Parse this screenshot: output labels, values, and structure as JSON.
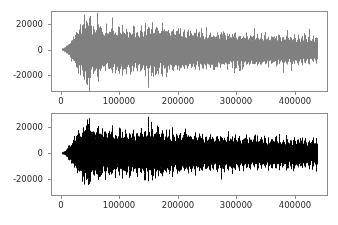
{
  "figure": {
    "width": 338,
    "height": 225,
    "background": "#ffffff",
    "frame_color": "#8c8c8c",
    "tick_label_color": "#2b2b2b"
  },
  "chart_data": [
    {
      "id": "top-waveform",
      "type": "area",
      "title": "",
      "xlabel": "",
      "ylabel": "",
      "series_color": "#808080",
      "xlim": [
        -17000,
        457000
      ],
      "ylim": [
        -33000,
        30000
      ],
      "xticks": [
        0,
        100000,
        200000,
        300000,
        400000
      ],
      "xticklabels": [
        "0",
        "100000",
        "200000",
        "300000",
        "400000"
      ],
      "yticks": [
        -20000,
        0,
        20000
      ],
      "yticklabels": [
        "-20000",
        "0",
        "20000"
      ],
      "grid": false,
      "legend": "none",
      "data_start_x": 0,
      "data_end_x": 440000,
      "sample_count": 277,
      "envelope_peak_positive": [
        900,
        1100,
        1400,
        1800,
        2300,
        2900,
        3600,
        4400,
        5200,
        6100,
        7200,
        8400,
        9500,
        10400,
        11200,
        12600,
        15800,
        13400,
        12800,
        16200,
        14600,
        13200,
        17400,
        21900,
        19200,
        16800,
        22600,
        25200,
        18900,
        17200,
        23800,
        20400,
        15600,
        14800,
        18200,
        16400,
        13900,
        15200,
        19600,
        23400,
        17800,
        14200,
        12800,
        16600,
        14400,
        12200,
        13600,
        15800,
        13100,
        11800,
        14900,
        17200,
        13400,
        12100,
        15600,
        18400,
        14200,
        12600,
        16100,
        13800,
        11900,
        14700,
        16900,
        13200,
        12400,
        15100,
        17600,
        13900,
        12700,
        14300,
        16800,
        13500,
        11600,
        14100,
        16200,
        12900,
        11400,
        13700,
        15900,
        12600,
        11200,
        13900,
        16400,
        12800,
        11700,
        14600,
        17100,
        13300,
        12200,
        15400,
        18900,
        14100,
        12500,
        16300,
        19700,
        14800,
        13100,
        16900,
        21200,
        15400,
        13600,
        17800,
        14200,
        12400,
        15600,
        18200,
        13800,
        12100,
        15200,
        17400,
        13400,
        11800,
        14600,
        16800,
        12900,
        11500,
        14200,
        16100,
        12700,
        11300,
        13900,
        15800,
        12400,
        11100,
        13600,
        15400,
        12200,
        10900,
        13300,
        15100,
        12000,
        10700,
        13100,
        14900,
        11800,
        10500,
        12900,
        14600,
        11600,
        10300,
        12700,
        14400,
        11400,
        10200,
        12500,
        14200,
        11200,
        10000,
        12300,
        14000,
        11000,
        9900,
        12100,
        13800,
        10900,
        9800,
        12000,
        13700,
        10800,
        9700,
        11900,
        13600,
        10700,
        9600,
        11800,
        13500,
        10600,
        9500,
        11700,
        13400,
        10500,
        9400,
        11600,
        13300,
        10400,
        9300,
        11500,
        13200,
        10300,
        9200,
        11400,
        13100,
        10200,
        9100,
        11300,
        13000,
        10100,
        9000,
        11200,
        12900,
        10000,
        8900,
        11100,
        12800,
        9900,
        8800,
        11000,
        12700,
        9800,
        8700,
        10900,
        12600,
        9700,
        8600,
        10800,
        12500,
        9600,
        8500,
        10700,
        12400,
        9500,
        8400,
        10600,
        12300,
        9400,
        8300,
        10500,
        12200,
        9300,
        8200,
        10400,
        12100,
        9200,
        8100,
        10300,
        12000,
        9100,
        8000,
        10200,
        11900,
        9000,
        7900,
        10100,
        11800,
        8900,
        7800,
        10000,
        11700,
        8800,
        7700,
        9900,
        11600,
        8700,
        7600,
        9800,
        11500,
        8600,
        7500,
        9700,
        11400,
        8500,
        7400,
        9600,
        11300,
        8400,
        7300,
        9500,
        11200,
        8300,
        7200,
        9400,
        11100,
        8200,
        7100,
        9300,
        11000,
        8100,
        7000,
        9200,
        10900,
        8000,
        6900,
        9100,
        10800,
        7900,
        6800,
        9000,
        10700,
        7800
      ],
      "envelope_peak_negative": [
        -900,
        -1100,
        -1400,
        -1800,
        -2300,
        -2900,
        -3600,
        -4400,
        -5200,
        -6100,
        -7200,
        -8400,
        -9500,
        -10400,
        -11200,
        -12600,
        -14800,
        -13400,
        -12800,
        -15200,
        -14600,
        -13200,
        -17400,
        -23900,
        -26200,
        -19800,
        -24600,
        -28200,
        -21900,
        -18200,
        -25800,
        -22400,
        -16600,
        -15800,
        -19200,
        -17400,
        -14900,
        -16200,
        -20600,
        -24400,
        -18800,
        -15200,
        -13800,
        -17600,
        -15400,
        -13200,
        -14600,
        -16800,
        -14100,
        -12800,
        -15900,
        -18200,
        -14400,
        -13100,
        -16600,
        -19400,
        -15200,
        -13600,
        -17100,
        -14800,
        -12900,
        -15700,
        -17900,
        -14200,
        -13400,
        -16100,
        -18600,
        -14900,
        -13700,
        -15300,
        -17800,
        -14500,
        -12600,
        -15100,
        -17200,
        -13900,
        -12400,
        -14700,
        -16900,
        -13600,
        -12200,
        -14900,
        -17400,
        -13800,
        -12700,
        -15600,
        -18100,
        -14300,
        -13200,
        -16400,
        -19900,
        -15100,
        -13500,
        -17300,
        -26700,
        -15800,
        -14100,
        -17900,
        -22200,
        -16400,
        -14600,
        -18800,
        -15200,
        -13400,
        -16600,
        -19200,
        -14800,
        -13100,
        -16200,
        -18400,
        -14400,
        -12800,
        -15600,
        -17800,
        -13900,
        -12500,
        -15200,
        -17100,
        -13700,
        -12300,
        -14900,
        -16800,
        -13400,
        -12100,
        -14600,
        -16400,
        -13200,
        -11900,
        -14300,
        -16100,
        -13000,
        -11700,
        -14100,
        -15900,
        -12800,
        -11500,
        -13900,
        -15600,
        -12600,
        -11300,
        -13700,
        -15400,
        -12400,
        -11200,
        -13500,
        -15200,
        -12200,
        -11000,
        -13300,
        -15000,
        -12000,
        -10900,
        -13100,
        -14800,
        -11900,
        -10800,
        -13000,
        -14700,
        -11800,
        -10700,
        -12900,
        -14600,
        -11700,
        -10600,
        -12800,
        -14500,
        -11600,
        -10500,
        -12700,
        -14400,
        -11500,
        -10400,
        -12600,
        -14300,
        -11400,
        -10300,
        -12500,
        -14200,
        -11300,
        -10200,
        -12400,
        -14100,
        -11200,
        -10100,
        -12300,
        -14000,
        -11100,
        -10000,
        -12200,
        -13900,
        -11000,
        -9900,
        -12100,
        -13800,
        -10900,
        -9800,
        -12000,
        -13700,
        -10800,
        -9700,
        -11900,
        -13600,
        -10700,
        -9600,
        -11800,
        -13500,
        -10600,
        -9500,
        -11700,
        -13400,
        -10500,
        -9400,
        -11600,
        -13300,
        -10400,
        -9300,
        -11500,
        -13200,
        -10300,
        -9200,
        -11400,
        -13100,
        -10200,
        -9100,
        -11300,
        -13000,
        -10100,
        -9000,
        -11200,
        -12900,
        -10000,
        -8900,
        -11100,
        -12800,
        -9900,
        -8800,
        -11000,
        -12700,
        -9800,
        -8700,
        -10900,
        -12600,
        -9700,
        -8600,
        -10800,
        -12500,
        -9600,
        -8500,
        -10700,
        -12400,
        -9500,
        -8400,
        -10600,
        -12300,
        -9400,
        -8300,
        -10500,
        -12200,
        -9300,
        -8200,
        -10400,
        -12100,
        -9200,
        -8100,
        -10300,
        -12000,
        -9100,
        -8000,
        -10200,
        -11900,
        -9000,
        -7900,
        -10100,
        -11800,
        -8900,
        -7800,
        -10000,
        -11700,
        -8800
      ]
    },
    {
      "id": "bottom-waveform",
      "type": "area",
      "title": "",
      "xlabel": "",
      "ylabel": "",
      "series_color": "#000000",
      "xlim": [
        -17000,
        457000
      ],
      "ylim": [
        -33000,
        31000
      ],
      "xticks": [
        0,
        100000,
        200000,
        300000,
        400000
      ],
      "xticklabels": [
        "0",
        "100000",
        "200000",
        "300000",
        "400000"
      ],
      "yticks": [
        -20000,
        0,
        20000
      ],
      "yticklabels": [
        "-20000",
        "0",
        "20000"
      ],
      "grid": false,
      "legend": "none",
      "data_start_x": 0,
      "data_end_x": 440000,
      "sample_count": 277,
      "envelope_peak_positive": [
        800,
        1000,
        1300,
        1700,
        2200,
        2800,
        3500,
        4300,
        5100,
        6000,
        7100,
        8300,
        9400,
        10300,
        11100,
        12500,
        16400,
        13300,
        12700,
        16900,
        14500,
        13100,
        18200,
        23800,
        20100,
        17200,
        24100,
        27600,
        19800,
        17600,
        25400,
        21200,
        16100,
        15200,
        19100,
        17000,
        14300,
        15800,
        20800,
        24900,
        18400,
        14600,
        13100,
        17200,
        14900,
        12500,
        14000,
        16400,
        13500,
        12100,
        15400,
        17900,
        13800,
        12400,
        16200,
        19200,
        14600,
        12900,
        16700,
        14200,
        12200,
        15200,
        17600,
        13600,
        12700,
        15700,
        18400,
        14300,
        13000,
        14800,
        17500,
        13900,
        11900,
        14600,
        16900,
        13200,
        11700,
        14200,
        16600,
        12900,
        11500,
        14400,
        17100,
        13200,
        12000,
        15100,
        17900,
        13700,
        12500,
        16000,
        20100,
        14600,
        12800,
        17000,
        21200,
        15400,
        13500,
        17700,
        23100,
        16100,
        14000,
        18600,
        14700,
        12700,
        16200,
        19100,
        14200,
        12400,
        15800,
        18200,
        13800,
        12100,
        15200,
        17600,
        13300,
        11800,
        14700,
        16800,
        13100,
        11600,
        14400,
        16500,
        12800,
        11400,
        14100,
        16000,
        12600,
        11200,
        13800,
        15700,
        12400,
        11000,
        13600,
        15400,
        12200,
        10800,
        13400,
        15200,
        12000,
        10600,
        13200,
        15000,
        11800,
        10500,
        13000,
        14800,
        11600,
        10300,
        12800,
        14600,
        11400,
        10200,
        12600,
        14400,
        11300,
        10100,
        12500,
        14300,
        11200,
        10000,
        12400,
        14200,
        11100,
        9900,
        12300,
        14100,
        11000,
        9800,
        12200,
        14000,
        10900,
        9700,
        12100,
        13900,
        10800,
        9600,
        12000,
        13800,
        10700,
        9500,
        11900,
        13700,
        10600,
        9400,
        11800,
        13600,
        10500,
        9300,
        11700,
        13500,
        10400,
        9200,
        11600,
        13400,
        10300,
        9100,
        11500,
        13300,
        10200,
        9000,
        11400,
        13200,
        10100,
        8900,
        11300,
        13100,
        10000,
        8800,
        11200,
        13000,
        9900,
        8700,
        11100,
        12900,
        9800,
        8600,
        11000,
        12800,
        9700,
        8500,
        10900,
        12700,
        9600,
        8400,
        10800,
        12600,
        9500,
        8300,
        10700,
        12500,
        9400,
        8200,
        10600,
        12400,
        9300,
        8100,
        10500,
        12300,
        9200,
        8000,
        10400,
        12200,
        9100,
        7900,
        10300,
        12100,
        9000,
        7800,
        10200,
        12000,
        8900,
        7700,
        10100,
        11900,
        8800,
        7600,
        10000,
        11800,
        8700,
        7500,
        9900,
        11700,
        8600,
        7400,
        9800,
        11600,
        8500,
        7300,
        9700,
        11500,
        8400,
        7200,
        9600,
        11400,
        8300,
        7100,
        9500,
        11300,
        8200
      ],
      "envelope_peak_negative": [
        -800,
        -1000,
        -1300,
        -1700,
        -2200,
        -2800,
        -3500,
        -4300,
        -5100,
        -6000,
        -7100,
        -8300,
        -9400,
        -10300,
        -11100,
        -12500,
        -15200,
        -13300,
        -12700,
        -15800,
        -14500,
        -13100,
        -18200,
        -21600,
        -22400,
        -18900,
        -22100,
        -23800,
        -20100,
        -17600,
        -22600,
        -20400,
        -16100,
        -15200,
        -19100,
        -17000,
        -14300,
        -15800,
        -19800,
        -21200,
        -18400,
        -14600,
        -13100,
        -17200,
        -14900,
        -12500,
        -14000,
        -16400,
        -13500,
        -12100,
        -15400,
        -17900,
        -13800,
        -12400,
        -16200,
        -19200,
        -14600,
        -12900,
        -16700,
        -14200,
        -12200,
        -15200,
        -17600,
        -13600,
        -12700,
        -15700,
        -18400,
        -14300,
        -13000,
        -14800,
        -17500,
        -13900,
        -11900,
        -14600,
        -16900,
        -13200,
        -11700,
        -14200,
        -16600,
        -12900,
        -11500,
        -14400,
        -17100,
        -13200,
        -12000,
        -15100,
        -17900,
        -13700,
        -12500,
        -16000,
        -20100,
        -14600,
        -12800,
        -17000,
        -21600,
        -15400,
        -13500,
        -17700,
        -20800,
        -16100,
        -14000,
        -18600,
        -14700,
        -12700,
        -16200,
        -19100,
        -14200,
        -12400,
        -15800,
        -18200,
        -13800,
        -12100,
        -15200,
        -17600,
        -13300,
        -11800,
        -14700,
        -16800,
        -13100,
        -11600,
        -14400,
        -16500,
        -12800,
        -11400,
        -14100,
        -16000,
        -12600,
        -11200,
        -13800,
        -15700,
        -12400,
        -11000,
        -13600,
        -15400,
        -12200,
        -10800,
        -13400,
        -15200,
        -12000,
        -10600,
        -13200,
        -15000,
        -11800,
        -10500,
        -13000,
        -14800,
        -11600,
        -10300,
        -12800,
        -14600,
        -11400,
        -10200,
        -12600,
        -14400,
        -11300,
        -10100,
        -12500,
        -14300,
        -11200,
        -10000,
        -12400,
        -14200,
        -11100,
        -9900,
        -12300,
        -14100,
        -11000,
        -9800,
        -12200,
        -14000,
        -10900,
        -9700,
        -12100,
        -13900,
        -10800,
        -9600,
        -12000,
        -13800,
        -10700,
        -9500,
        -11900,
        -13700,
        -10600,
        -9400,
        -11800,
        -13600,
        -10500,
        -9300,
        -11700,
        -13500,
        -10400,
        -9200,
        -11600,
        -13400,
        -10300,
        -9100,
        -11500,
        -13300,
        -10200,
        -9000,
        -11400,
        -13200,
        -10100,
        -8900,
        -11300,
        -13100,
        -10000,
        -8800,
        -11200,
        -13000,
        -9900,
        -8700,
        -11100,
        -12900,
        -9800,
        -8600,
        -11000,
        -12800,
        -9700,
        -8500,
        -10900,
        -12700,
        -9600,
        -8400,
        -10800,
        -12600,
        -9500,
        -8300,
        -10700,
        -12500,
        -9400,
        -8200,
        -10600,
        -12400,
        -9300,
        -8100,
        -10500,
        -12300,
        -9200,
        -8000,
        -10400,
        -12200,
        -9100,
        -7900,
        -10300,
        -12100,
        -9000,
        -7800,
        -10200,
        -12000,
        -8900,
        -7700,
        -10100,
        -11900,
        -8800,
        -7600,
        -10000,
        -11800,
        -8700,
        -7500,
        -9900,
        -11700,
        -8600,
        -7400,
        -9800,
        -11600,
        -8500,
        -7300,
        -9700,
        -11500,
        -8400,
        -7200,
        -9600,
        -11400,
        -8300,
        -7100,
        -9500,
        -11300,
        -8200
      ]
    }
  ]
}
